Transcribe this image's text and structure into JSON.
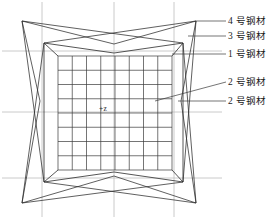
{
  "figure": {
    "title": "",
    "width": 278,
    "height": 219,
    "background_color": "#ffffff",
    "line_color": "#2a2a2a",
    "grid_color": "#4a4a4a",
    "guide_color": "#b8b8b8"
  },
  "center_marker": {
    "text": "+z"
  },
  "callouts": [
    {
      "id": "callout-4",
      "text": "4 号钢材",
      "label_x": 228,
      "label_y": 17,
      "leader_x1": 196,
      "leader_y1": 21,
      "leader_x2": 226,
      "leader_y2": 21
    },
    {
      "id": "callout-3",
      "text": "3 号钢材",
      "label_x": 228,
      "label_y": 32,
      "leader_x1": 188,
      "leader_y1": 36,
      "leader_x2": 226,
      "leader_y2": 36
    },
    {
      "id": "callout-1",
      "text": "1 号钢材",
      "label_x": 228,
      "label_y": 50,
      "leader_x1": 172,
      "leader_y1": 54,
      "leader_x2": 226,
      "leader_y2": 54
    },
    {
      "id": "callout-2a",
      "text": "2 号钢材",
      "label_x": 228,
      "label_y": 78,
      "leader_x1": 155,
      "leader_y1": 101,
      "leader_x2": 226,
      "leader_y2": 82
    },
    {
      "id": "callout-2b",
      "text": "2 号钢材",
      "label_x": 228,
      "label_y": 97,
      "leader_x1": 178,
      "leader_y1": 101,
      "leader_x2": 226,
      "leader_y2": 101
    }
  ],
  "guides": {
    "vertical_x": [
      42,
      114,
      174
    ],
    "horizontal_y": [
      51,
      112,
      178
    ]
  },
  "grid": {
    "columns": 8,
    "rows": 8
  },
  "geometry": {
    "outer_star": {
      "description": "four-pointed concave star outline",
      "points": [
        [
          22,
          21
        ],
        [
          114,
          44
        ],
        [
          196,
          21
        ],
        [
          181,
          101
        ],
        [
          196,
          203
        ],
        [
          114,
          176
        ],
        [
          22,
          203
        ],
        [
          40,
          101
        ]
      ]
    },
    "inner_box_top": [
      [
        44,
        43
      ],
      [
        114,
        53
      ],
      [
        183,
        43
      ]
    ],
    "inner_box_bottom": [
      [
        44,
        182
      ],
      [
        114,
        172
      ],
      [
        183,
        182
      ]
    ],
    "panel": {
      "left": 58,
      "top": 56,
      "right": 172,
      "bottom": 170
    }
  }
}
